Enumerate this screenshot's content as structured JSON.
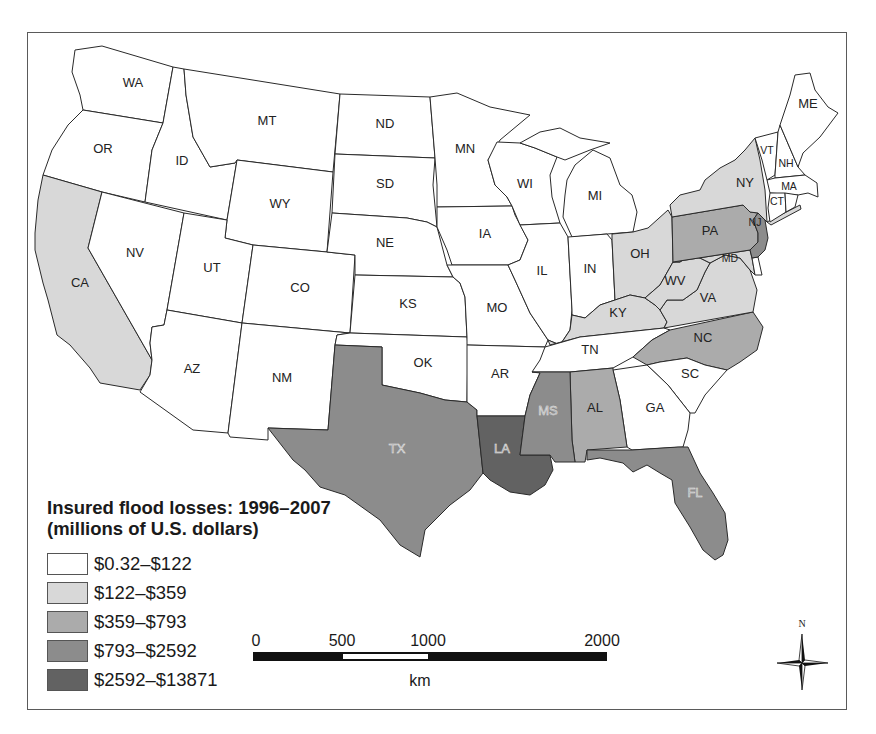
{
  "legend": {
    "title_line1": "Insured flood losses: 1996–2007",
    "title_line2": "(millions of U.S. dollars)",
    "items": [
      {
        "label": "$0.32–$122",
        "color": "#ffffff"
      },
      {
        "label": "$122–$359",
        "color": "#d8d8d8"
      },
      {
        "label": "$359–$793",
        "color": "#ababab"
      },
      {
        "label": "$793–$2592",
        "color": "#8c8c8c"
      },
      {
        "label": "$2592–$13871",
        "color": "#626262"
      }
    ]
  },
  "scale_bar": {
    "ticks": [
      "0",
      "500",
      "1000",
      "2000"
    ],
    "unit": "km"
  },
  "compass": {
    "north_label": "N"
  },
  "map_data": {
    "type": "choropleth",
    "title": "Insured flood losses: 1996–2007 (millions of U.S. dollars)",
    "classes": [
      "$0.32–$122",
      "$122–$359",
      "$359–$793",
      "$793–$2592",
      "$2592–$13871"
    ],
    "states": [
      {
        "id": "WA",
        "cls": 0,
        "lx": 133,
        "ly": 82,
        "pts": "75,50 102,46 173,67 163,123 120,116 83,110 80,95 72,72"
      },
      {
        "id": "OR",
        "cls": 0,
        "lx": 103,
        "ly": 148,
        "pts": "83,110 120,116 163,123 152,150 145,202 102,192 43,175 52,150 68,125"
      },
      {
        "id": "ID",
        "cls": 0,
        "lx": 182,
        "ly": 160,
        "pts": "173,67 184,69 186,95 193,137 210,167 235,163 237,160 227,220 145,202 152,150 163,123"
      },
      {
        "id": "MT",
        "cls": 0,
        "lx": 267,
        "ly": 120,
        "pts": "184,69 340,94 333,172 237,160 235,163 210,167 193,137 186,95"
      },
      {
        "id": "ND",
        "cls": 0,
        "lx": 385,
        "ly": 123,
        "pts": "340,94 430,97 435,158 335,154"
      },
      {
        "id": "SD",
        "cls": 0,
        "lx": 385,
        "ly": 183,
        "pts": "335,154 435,158 433,185 437,227 427,222 407,218 332,213"
      },
      {
        "id": "WY",
        "cls": 0,
        "lx": 280,
        "ly": 203,
        "pts": "237,160 333,172 327,252 253,245 225,238 227,220"
      },
      {
        "id": "CA",
        "cls": 1,
        "lx": 80,
        "ly": 282,
        "pts": "43,175 102,192 100,200 88,248 152,360 150,375 140,390 100,383 90,368 70,345 57,335 48,300 43,283 35,250 35,233 38,200"
      },
      {
        "id": "NV",
        "cls": 0,
        "lx": 135,
        "ly": 252,
        "pts": "102,192 184,213 167,310 164,325 152,327 150,343 152,360 88,248 100,200"
      },
      {
        "id": "UT",
        "cls": 0,
        "lx": 212,
        "ly": 267,
        "pts": "184,213 227,220 225,238 253,245 242,323 167,310"
      },
      {
        "id": "AZ",
        "cls": 0,
        "lx": 192,
        "ly": 368,
        "pts": "167,310 242,323 228,433 193,430 140,392 150,375 152,360 150,343 152,327 164,325"
      },
      {
        "id": "CO",
        "cls": 0,
        "lx": 300,
        "ly": 287,
        "pts": "253,245 327,252 355,255 350,333 242,323"
      },
      {
        "id": "NE",
        "cls": 0,
        "lx": 385,
        "ly": 242,
        "pts": "332,213 407,218 427,222 437,227 447,265 453,277 355,275 355,255 327,252"
      },
      {
        "id": "KS",
        "cls": 0,
        "lx": 408,
        "ly": 303,
        "pts": "355,275 453,277 460,283 465,297 467,337 350,333"
      },
      {
        "id": "NM",
        "cls": 0,
        "lx": 282,
        "ly": 377,
        "pts": "242,323 350,333 337,335 335,345 328,430 268,428 268,440 230,437 228,433"
      },
      {
        "id": "OK",
        "cls": 0,
        "lx": 423,
        "ly": 362,
        "pts": "350,333 467,337 468,345 467,402 445,400 420,393 382,385 382,347 335,345 337,335"
      },
      {
        "id": "TX",
        "cls": 3,
        "lx": 397,
        "ly": 448,
        "light": true,
        "pts": "335,345 382,347 382,385 420,393 445,400 467,402 477,410 477,416 483,473 470,490 450,505 425,530 420,557 400,545 380,520 345,495 320,487 305,470 293,460 268,428 328,430"
      },
      {
        "id": "MN",
        "cls": 0,
        "lx": 465,
        "ly": 148,
        "pts": "430,97 457,93 490,107 530,115 500,140 488,160 495,185 507,197 512,206 437,207 437,185 435,158"
      },
      {
        "id": "IA",
        "cls": 0,
        "lx": 485,
        "ly": 233,
        "pts": "437,207 512,206 515,215 528,240 520,260 508,265 452,265 447,250 437,227"
      },
      {
        "id": "MO",
        "cls": 0,
        "lx": 497,
        "ly": 307,
        "pts": "447,265 508,265 515,280 530,313 548,340 545,347 467,345 467,337 465,297 460,283 453,277"
      },
      {
        "id": "AR",
        "cls": 0,
        "lx": 500,
        "ly": 373,
        "pts": "467,345 545,347 548,355 540,373 530,395 525,416 477,416 477,410 467,402"
      },
      {
        "id": "LA",
        "cls": 4,
        "lx": 502,
        "ly": 448,
        "light": true,
        "pts": "477,416 525,416 520,455 550,455 553,470 545,485 530,495 510,492 490,480 483,473"
      },
      {
        "id": "WI",
        "cls": 0,
        "lx": 525,
        "ly": 183,
        "pts": "497,142 520,143 535,148 557,157 550,175 552,197 560,223 520,225 512,206 507,197 495,185 488,160"
      },
      {
        "id": "MI",
        "cls": 0,
        "lx": 595,
        "ly": 195,
        "pts": "567,180 575,165 593,150 610,158 620,185 632,195 637,212 633,232 607,234 572,237 563,217 565,195"
      },
      {
        "id": "MI-UP",
        "cls": 0,
        "pts": "520,143 540,132 560,128 580,138 610,143 590,150 565,160 557,157 535,148"
      },
      {
        "id": "IL",
        "cls": 0,
        "lx": 542,
        "ly": 270,
        "pts": "520,225 560,223 568,237 572,310 570,330 560,345 548,340 530,313 515,280 508,265 520,260 528,240"
      },
      {
        "id": "IN",
        "cls": 0,
        "lx": 590,
        "ly": 268,
        "pts": "568,237 607,234 612,240 615,300 600,305 585,318 572,315 572,310"
      },
      {
        "id": "OH",
        "cls": 1,
        "lx": 640,
        "ly": 253,
        "pts": "612,234 633,232 648,228 668,210 672,217 673,262 660,285 645,298 630,295 615,300 612,240"
      },
      {
        "id": "KY",
        "cls": 1,
        "lx": 618,
        "ly": 312,
        "pts": "548,340 560,345 570,330 572,315 585,318 600,305 615,300 630,295 645,298 655,305 660,310 667,322 664,328 580,337 550,345"
      },
      {
        "id": "TN",
        "cls": 0,
        "lx": 590,
        "ly": 349,
        "pts": "545,347 580,337 664,328 670,330 652,340 633,357 613,368 570,372 532,372 540,360"
      },
      {
        "id": "NC",
        "cls": 2,
        "lx": 703,
        "ly": 337,
        "pts": "670,330 753,312 763,327 757,350 740,362 727,370 705,365 687,358 660,362 647,365 633,357 652,340"
      },
      {
        "id": "SC",
        "cls": 0,
        "lx": 690,
        "ly": 373,
        "pts": "647,365 660,362 687,358 705,365 727,370 705,395 695,413 690,413 668,385"
      },
      {
        "id": "GA",
        "cls": 0,
        "lx": 655,
        "ly": 407,
        "pts": "613,370 647,365 668,385 690,413 688,430 683,447 632,450 627,447 620,400"
      },
      {
        "id": "AL",
        "cls": 2,
        "lx": 595,
        "ly": 407,
        "pts": "570,372 613,368 613,370 620,400 627,447 587,450 585,462 575,462 572,440"
      },
      {
        "id": "MS",
        "cls": 3,
        "lx": 548,
        "ly": 410,
        "light": true,
        "pts": "532,372 570,372 572,440 575,462 555,462 550,455 520,455 525,416 530,395 540,373"
      },
      {
        "id": "FL",
        "cls": 3,
        "lx": 695,
        "ly": 492,
        "light": true,
        "pts": "587,450 632,450 678,447 688,447 700,473 713,493 725,513 728,540 723,555 715,560 703,550 690,527 675,503 672,480 660,473 647,465 633,472 623,463 600,458 587,460"
      },
      {
        "id": "VA",
        "cls": 1,
        "lx": 708,
        "ly": 297,
        "pts": "660,310 667,300 683,300 697,290 705,272 710,263 725,255 740,258 750,270 757,290 753,312 664,328 667,322"
      },
      {
        "id": "WV",
        "cls": 1,
        "lx": 675,
        "ly": 280,
        "pts": "645,298 660,285 673,262 680,262 690,255 700,258 710,263 705,272 697,290 683,300 667,300 660,310 655,305"
      },
      {
        "id": "MD",
        "cls": 1,
        "lx": 730,
        "ly": 258,
        "small": true,
        "pts": "673,262 750,250 752,258 755,275 750,270 740,258 725,255 710,263 700,258 690,255 680,262"
      },
      {
        "id": "DE",
        "cls": 0,
        "pts": "752,258 758,257 762,275 755,275"
      },
      {
        "id": "PA",
        "cls": 2,
        "lx": 710,
        "ly": 230,
        "pts": "672,217 743,205 750,212 758,213 753,220 758,233 758,242 750,250 673,262"
      },
      {
        "id": "NJ",
        "cls": 3,
        "lx": 755,
        "ly": 222,
        "small": true,
        "pts": "758,213 765,220 768,238 765,250 758,257 752,258 750,250 758,242 758,233 753,220"
      },
      {
        "id": "NY",
        "cls": 1,
        "lx": 745,
        "ly": 182,
        "pts": "670,205 680,195 700,190 705,180 720,168 735,160 745,150 755,138 760,160 765,190 767,222 765,220 758,213 750,212 743,205 672,217"
      },
      {
        "id": "NY-LI",
        "cls": 1,
        "pts": "767,222 800,205 801,209 771,225"
      },
      {
        "id": "VT",
        "cls": 0,
        "lx": 767,
        "ly": 150,
        "small": true,
        "pts": "755,138 778,132 775,175 767,180 762,160"
      },
      {
        "id": "NH",
        "cls": 0,
        "lx": 786,
        "ly": 163,
        "small": true,
        "pts": "778,132 780,125 798,167 805,175 775,178 775,175"
      },
      {
        "id": "ME",
        "cls": 0,
        "lx": 808,
        "ly": 103,
        "pts": "780,125 790,95 795,75 810,73 815,90 828,107 838,113 820,137 803,153 798,167"
      },
      {
        "id": "MA",
        "cls": 0,
        "lx": 789,
        "ly": 186,
        "small": true,
        "pts": "767,180 775,178 805,175 817,183 818,197 808,193 798,195 770,193"
      },
      {
        "id": "CT",
        "cls": 0,
        "lx": 777,
        "ly": 201,
        "small": true,
        "pts": "770,193 785,193 786,212 770,222 768,208"
      },
      {
        "id": "RI",
        "cls": 0,
        "pts": "785,193 798,195 795,207 786,212"
      }
    ]
  }
}
